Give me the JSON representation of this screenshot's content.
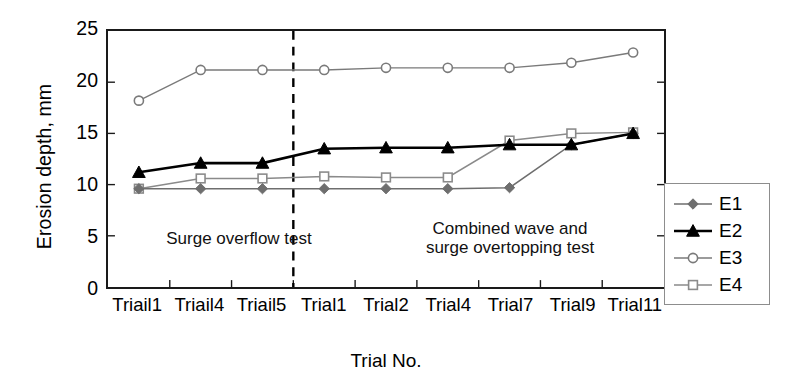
{
  "chart_data": {
    "type": "line",
    "title": "",
    "xlabel": "Trial No.",
    "ylabel": "Erosion depth, mm",
    "categories": [
      "Triail1",
      "Triail4",
      "Triail5",
      "Trial1",
      "Trial2",
      "Trial4",
      "Trial7",
      "Trial9",
      "Trial11"
    ],
    "ylim": [
      0,
      25
    ],
    "yticks": [
      25,
      20,
      15,
      10,
      5,
      0
    ],
    "xlim_categories": 9,
    "grid": false,
    "legend_position": "inside-bottom-right",
    "series": [
      {
        "name": "E1",
        "marker": "filled-diamond",
        "color": "#6e6e6e",
        "line_color": "#6e6e6e",
        "values": [
          9.6,
          9.6,
          9.6,
          9.6,
          9.6,
          9.6,
          9.7,
          13.9,
          15.0
        ]
      },
      {
        "name": "E2",
        "marker": "filled-triangle",
        "color": "#000000",
        "line_color": "#000000",
        "values": [
          11.2,
          12.1,
          12.1,
          13.5,
          13.6,
          13.6,
          13.9,
          13.9,
          15.0
        ]
      },
      {
        "name": "E3",
        "marker": "open-circle",
        "color": "#7a7a7a",
        "line_color": "#7a7a7a",
        "values": [
          18.2,
          21.2,
          21.2,
          21.2,
          21.4,
          21.4,
          21.4,
          21.9,
          22.9
        ]
      },
      {
        "name": "E4",
        "marker": "open-square",
        "color": "#8a8a8a",
        "line_color": "#8a8a8a",
        "values": [
          9.6,
          10.6,
          10.6,
          10.8,
          10.7,
          10.7,
          14.3,
          15.0,
          15.1
        ]
      }
    ],
    "annotations": [
      {
        "name": "surge-overflow-test",
        "text": "Surge overflow test"
      },
      {
        "name": "combined-wave-test",
        "text": "Combined wave and\nsurge overtopping test"
      }
    ],
    "divider": {
      "after_category_index": 2,
      "style": "dashed",
      "color": "#000000"
    }
  },
  "legend": {
    "entries": [
      {
        "label": "E1"
      },
      {
        "label": "E2"
      },
      {
        "label": "E3"
      },
      {
        "label": "E4"
      }
    ]
  }
}
